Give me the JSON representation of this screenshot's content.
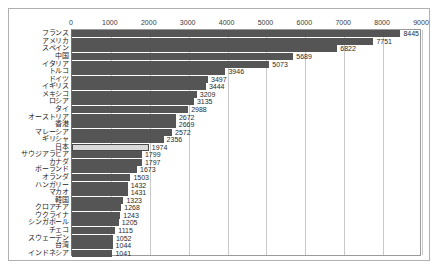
{
  "chart_data": {
    "type": "bar",
    "orientation": "horizontal",
    "title": "",
    "subtitle": "",
    "xlabel": "",
    "ylabel": "",
    "xlim": [
      0,
      9000
    ],
    "xticks": [
      0,
      1000,
      2000,
      3000,
      4000,
      5000,
      6000,
      7000,
      8000,
      9000
    ],
    "xtick_labels": [
      "0",
      "1000",
      "2000",
      "3000",
      "4000",
      "5000",
      "6000",
      "7000",
      "8000",
      "9000"
    ],
    "grid": true,
    "grid_axis": "x",
    "legend": false,
    "legend_position": "none",
    "value_labels": true,
    "highlight_category": "日本",
    "colors": {
      "bar": "#555555",
      "highlight_bar": "#d9d9d9",
      "highlight_border": "#4a4a4a",
      "gridline": "#c9c9c9",
      "axis": "#9a9a9a",
      "frame": "#b0b0b0",
      "text": "#1d1d1d"
    },
    "categories": [
      "フランス",
      "アメリカ",
      "スペイン",
      "中国",
      "イタリア",
      "トルコ",
      "ドイツ",
      "イギリス",
      "メキシコ",
      "ロシア",
      "タイ",
      "オーストリア",
      "香港",
      "マレーシア",
      "ギリシャ",
      "日本",
      "サウジアラビア",
      "カナダ",
      "ポーランド",
      "オランダ",
      "ハンガリー",
      "マカオ",
      "韓国",
      "クロアチア",
      "ウクライナ",
      "シンガポール",
      "チェコ",
      "スウェーデン",
      "台湾",
      "インドネシア"
    ],
    "values": [
      8445,
      7751,
      6822,
      5689,
      5073,
      3946,
      3497,
      3444,
      3209,
      3135,
      2988,
      2672,
      2669,
      2572,
      2356,
      1974,
      1799,
      1797,
      1673,
      1503,
      1432,
      1431,
      1323,
      1268,
      1243,
      1205,
      1115,
      1052,
      1044,
      1041
    ],
    "value_label_texts": [
      "8445",
      "7751",
      "6822",
      "5689",
      "5073",
      "3946",
      "3497",
      "3444",
      "3209",
      "3135",
      "2988",
      "2672",
      "2669",
      "2572",
      "2356",
      "1974",
      "1799",
      "1797",
      "1673",
      "1503",
      "1432",
      "1431",
      "1323",
      "1268",
      "1243",
      "1205",
      "1115",
      "1052",
      "1044",
      "1041"
    ]
  }
}
